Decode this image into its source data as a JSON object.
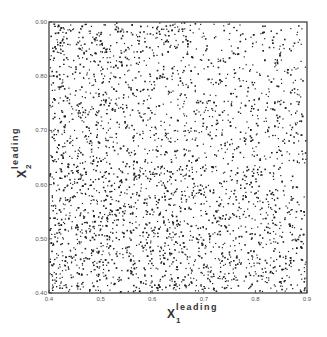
{
  "chart_data": {
    "type": "scatter",
    "title": "",
    "xlabel": "X1 leading",
    "ylabel": "X2 leading",
    "xlabel_parts": {
      "symbol": "X",
      "subscript": "1",
      "superscript": "leading"
    },
    "ylabel_parts": {
      "symbol": "X",
      "subscript": "2",
      "superscript": "leading"
    },
    "xlim": [
      0.4,
      0.9
    ],
    "ylim": [
      0.4,
      0.9
    ],
    "xticks": [
      "0.4",
      "0.5",
      "0.6",
      "0.7",
      "0.8",
      "0.9"
    ],
    "yticks": [
      "0.40",
      "0.50",
      "0.60",
      "0.70",
      "0.80",
      "0.90"
    ],
    "grid": false,
    "legend": null,
    "series": [
      {
        "name": "events",
        "point_count_estimate": 3500,
        "distribution": "dense uniform scatter filling the whole square; density highest toward low X1 / low X2 (lower-left) and decreasing toward high X1 / high X2 (upper-right)",
        "marker": "small dot",
        "color": "#222222"
      }
    ]
  }
}
